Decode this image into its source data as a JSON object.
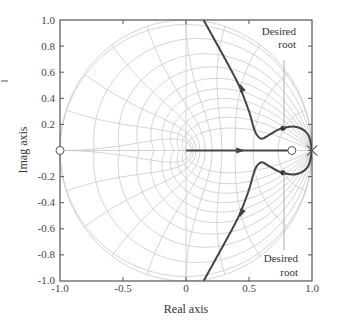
{
  "chart_data": {
    "type": "line",
    "title": "",
    "subtitle": "Root locus in the z-plane with constant damping / natural frequency grid",
    "xlabel": "Real axis",
    "ylabel": "Imag axis",
    "xlim": [
      -1.0,
      1.0
    ],
    "ylim": [
      -1.0,
      1.0
    ],
    "grid": "z-plane zeta/wn grid (light gray)",
    "x_ticks": [
      "-1.0",
      "-0.5",
      "0",
      "0.5",
      "1.0"
    ],
    "y_ticks": [
      "1.0",
      "0.8",
      "0.6",
      "0.4",
      "0.2",
      "0",
      "-0.2",
      "-0.4",
      "-0.6",
      "-0.8",
      "-1.0"
    ],
    "poles": [
      {
        "re": 1.0,
        "im": 0.0,
        "marker": "x"
      },
      {
        "re": 1.0,
        "im": 0.0,
        "marker": "x"
      }
    ],
    "zeros": [
      {
        "re": 0.84,
        "im": 0.0,
        "marker": "o"
      },
      {
        "re": -1.0,
        "im": 0.0,
        "marker": "o"
      }
    ],
    "series": [
      {
        "name": "upper branch",
        "points": [
          [
            1.0,
            0.0
          ],
          [
            0.97,
            0.12
          ],
          [
            0.88,
            0.18
          ],
          [
            0.76,
            0.17
          ],
          [
            0.66,
            0.12
          ],
          [
            0.6,
            0.09
          ],
          [
            0.55,
            0.14
          ],
          [
            0.5,
            0.3
          ],
          [
            0.42,
            0.5
          ],
          [
            0.3,
            0.72
          ],
          [
            0.14,
            1.0
          ]
        ]
      },
      {
        "name": "lower branch",
        "points": [
          [
            1.0,
            0.0
          ],
          [
            0.97,
            -0.12
          ],
          [
            0.88,
            -0.18
          ],
          [
            0.76,
            -0.17
          ],
          [
            0.66,
            -0.12
          ],
          [
            0.6,
            -0.09
          ],
          [
            0.55,
            -0.14
          ],
          [
            0.5,
            -0.3
          ],
          [
            0.42,
            -0.5
          ],
          [
            0.3,
            -0.72
          ],
          [
            0.14,
            -1.0
          ]
        ]
      },
      {
        "name": "real-axis branch",
        "points": [
          [
            0.0,
            0.0
          ],
          [
            0.84,
            0.0
          ]
        ]
      },
      {
        "name": "left real-axis branch",
        "points": [
          [
            -1.05,
            0.0
          ],
          [
            -1.0,
            0.0
          ]
        ]
      }
    ],
    "desired_roots": [
      {
        "re": 0.77,
        "im": 0.17
      },
      {
        "re": 0.77,
        "im": -0.17
      }
    ],
    "annotations": [
      {
        "text": "Desired\nroot",
        "position": "upper right",
        "points_to": [
          0.77,
          0.17
        ]
      },
      {
        "text": "Desired\nroot",
        "position": "lower right",
        "points_to": [
          0.77,
          -0.17
        ]
      }
    ]
  },
  "labels": {
    "xlabel": "Real axis",
    "ylabel": "Imag axis",
    "annot_top_l1": "Desired",
    "annot_top_l2": "root",
    "annot_bot_l1": "Desired",
    "annot_bot_l2": "root",
    "x_ticks": [
      "-1.0",
      "-0.5",
      "0",
      "0.5",
      "1.0"
    ],
    "y_ticks": [
      "1.0",
      "0.8",
      "0.6",
      "0.4",
      "0.2",
      "0",
      "-0.2",
      "-0.4",
      "-0.6",
      "-0.8",
      "-1.0"
    ]
  },
  "colors": {
    "grid": "#c8c8c8",
    "locus": "#444444",
    "frame": "#555555"
  }
}
